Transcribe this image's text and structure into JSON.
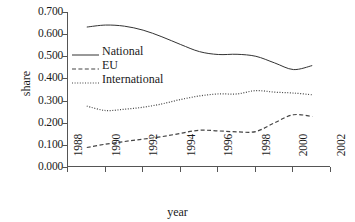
{
  "chart_data": {
    "type": "line",
    "title": "",
    "xlabel": "year",
    "ylabel": "share",
    "xlim": [
      1988,
      2002
    ],
    "ylim": [
      0.0,
      0.7
    ],
    "xticks": [
      "1988",
      "1990",
      "1992",
      "1994",
      "1996",
      "1998",
      "2000",
      "2002"
    ],
    "xtick_values": [
      1988,
      1990,
      1992,
      1994,
      1996,
      1998,
      2000,
      2002
    ],
    "yticks": [
      "0.000",
      "0.100",
      "0.200",
      "0.300",
      "0.400",
      "0.500",
      "0.600",
      "0.700"
    ],
    "ytick_values": [
      0.0,
      0.1,
      0.2,
      0.3,
      0.4,
      0.5,
      0.6,
      0.7
    ],
    "grid": false,
    "legend_position": "upper left inside",
    "x": [
      1989,
      1990,
      1991,
      1992,
      1993,
      1994,
      1995,
      1996,
      1997,
      1998,
      1999,
      2000,
      2001
    ],
    "series": [
      {
        "name": "National",
        "style": "solid",
        "color": "#333333",
        "values": [
          0.632,
          0.641,
          0.636,
          0.618,
          0.588,
          0.553,
          0.521,
          0.508,
          0.509,
          0.5,
          0.47,
          0.44,
          0.458
        ]
      },
      {
        "name": "EU",
        "style": "dashed",
        "color": "#444444",
        "values": [
          0.088,
          0.103,
          0.115,
          0.126,
          0.137,
          0.152,
          0.166,
          0.163,
          0.159,
          0.16,
          0.2,
          0.236,
          0.228
        ]
      },
      {
        "name": "International",
        "style": "dotted",
        "color": "#444444",
        "values": [
          0.275,
          0.255,
          0.261,
          0.27,
          0.285,
          0.305,
          0.321,
          0.33,
          0.33,
          0.345,
          0.338,
          0.334,
          0.326
        ]
      }
    ]
  }
}
